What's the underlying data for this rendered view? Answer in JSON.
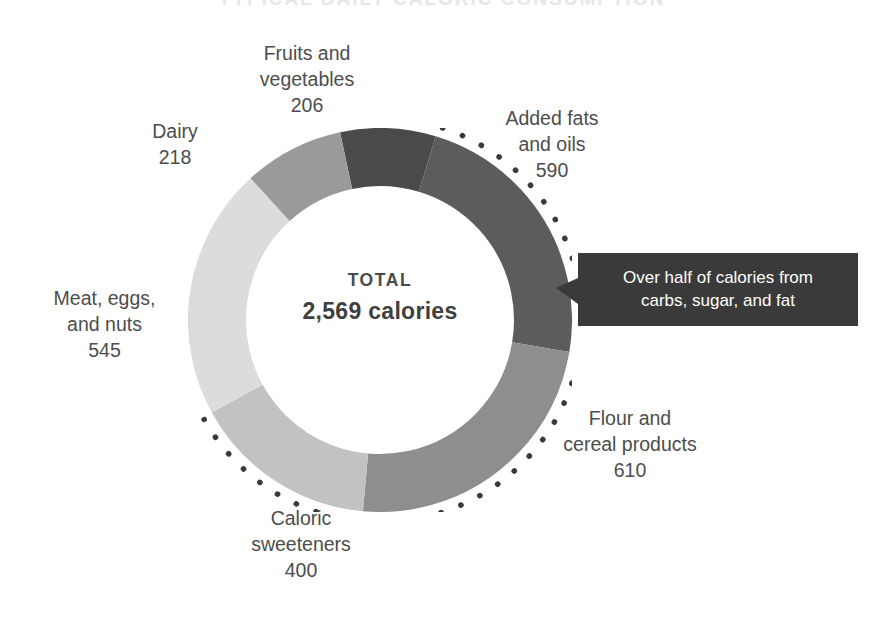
{
  "header": {
    "title": "TYPICAL DAILY CALORIC CONSUMPTION"
  },
  "center": {
    "total_label": "TOTAL",
    "total_value": "2,569 calories"
  },
  "callout": {
    "line1": "Over half of calories from",
    "line2": "carbs, sugar, and fat",
    "background_color": "#3a3a3a",
    "text_color": "#ffffff"
  },
  "labels": {
    "fruits": {
      "name_line1": "Fruits and",
      "name_line2": "vegetables",
      "value": "206"
    },
    "fats": {
      "name_line1": "Added fats",
      "name_line2": "and oils",
      "value": "590"
    },
    "dairy": {
      "name_line1": "Dairy",
      "value": "218"
    },
    "meat": {
      "name_line1": "Meat, eggs,",
      "name_line2": "and nuts",
      "value": "545"
    },
    "sweeteners": {
      "name_line1": "Caloric",
      "name_line2": "sweeteners",
      "value": "400"
    },
    "flour": {
      "name_line1": "Flour and",
      "name_line2": "cereal products",
      "value": "610"
    }
  },
  "chart_data": {
    "type": "pie",
    "variant": "donut",
    "title": "TYPICAL DAILY CALORIC CONSUMPTION",
    "unit": "calories",
    "total": 2569,
    "total_label": "TOTAL",
    "total_display": "2,569 calories",
    "start_angle_deg": -12,
    "direction": "clockwise",
    "inner_radius_ratio": 0.705,
    "legend": "none-labels-outside",
    "grid": false,
    "categories": [
      "Fruits and vegetables",
      "Added fats and oils",
      "Flour and cereal products",
      "Caloric sweeteners",
      "Meat, eggs, and nuts",
      "Dairy"
    ],
    "values": [
      206,
      590,
      610,
      400,
      545,
      218
    ],
    "percentages": [
      8.0,
      23.0,
      23.7,
      15.6,
      21.2,
      8.5
    ],
    "colors": [
      "#4a4a4a",
      "#5c5c5c",
      "#8e8e8e",
      "#c2c2c2",
      "#dcdcdc",
      "#9a9a9a"
    ],
    "slices": [
      {
        "label": "Fruits and vegetables",
        "value": 206,
        "percent": 8.0,
        "color": "#4a4a4a"
      },
      {
        "label": "Added fats and oils",
        "value": 590,
        "percent": 23.0,
        "color": "#5c5c5c"
      },
      {
        "label": "Flour and cereal products",
        "value": 610,
        "percent": 23.7,
        "color": "#8e8e8e"
      },
      {
        "label": "Caloric sweeteners",
        "value": 400,
        "percent": 15.6,
        "color": "#c2c2c2"
      },
      {
        "label": "Meat, eggs, and nuts",
        "value": 545,
        "percent": 21.2,
        "color": "#dcdcdc"
      },
      {
        "label": "Dairy",
        "value": 218,
        "percent": 8.5,
        "color": "#9a9a9a"
      }
    ],
    "annotations": [
      {
        "text": "Over half of calories from carbs, sugar, and fat",
        "style": "dark-box-callout-left-arrow",
        "covers": [
          "Added fats and oils",
          "Flour and cereal products",
          "Caloric sweeteners"
        ],
        "marker": "dotted-arc-outside-donut"
      }
    ]
  }
}
